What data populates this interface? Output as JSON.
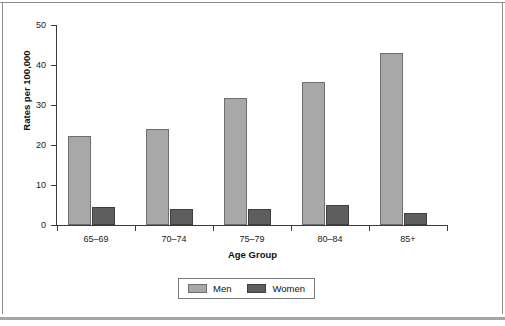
{
  "chart_data": {
    "type": "bar",
    "title": "",
    "subtitle": "",
    "xlabel": "Age Group",
    "ylabel": "Rates per 100,000",
    "categories": [
      "65–69",
      "70–74",
      "75–79",
      "80–84",
      "85+"
    ],
    "series": [
      {
        "name": "Men",
        "color": "#a8a8a8",
        "values": [
          22.2,
          23.9,
          31.7,
          35.8,
          43.0
        ]
      },
      {
        "name": "Women",
        "color": "#5e5e5e",
        "values": [
          4.5,
          3.9,
          3.9,
          4.9,
          2.9
        ]
      }
    ],
    "ylim": [
      0,
      50
    ],
    "yticks": [
      0,
      10,
      20,
      30,
      40,
      50
    ],
    "ytick_labels": [
      "0",
      "10",
      "20",
      "30",
      "40",
      "50"
    ],
    "grid": false,
    "legend_position": "bottom-center",
    "legend_entries": [
      "Men",
      "Women"
    ]
  },
  "figure": {
    "background_color": "#ffffff",
    "axis_color": "#3a3a3a",
    "frame_color": "#8c8c8c"
  }
}
